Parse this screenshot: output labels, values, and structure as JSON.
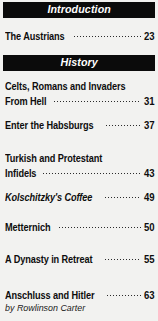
{
  "document": {
    "type": "table-of-contents",
    "background_color": "#f2f2f0",
    "bar_color": "#0b0b0b",
    "text_color": "#0d0d0d"
  },
  "sections": [
    {
      "heading": "Introduction",
      "entries": [
        {
          "title_lines": [
            "The Austrians"
          ],
          "page": "23",
          "italic": false,
          "byline": null
        }
      ]
    },
    {
      "heading": "History",
      "entries": [
        {
          "title_lines": [
            "Celts, Romans and Invaders",
            "From Hell"
          ],
          "page": "31",
          "italic": false,
          "byline": null
        },
        {
          "title_lines": [
            "Enter the Habsburgs"
          ],
          "page": "37",
          "italic": false,
          "byline": null
        },
        {
          "title_lines": [
            "Turkish and Protestant",
            "Infidels"
          ],
          "page": "43",
          "italic": false,
          "byline": null
        },
        {
          "title_lines": [
            "Kolschitzky's Coffee"
          ],
          "page": "49",
          "italic": true,
          "byline": null
        },
        {
          "title_lines": [
            "Metternich"
          ],
          "page": "50",
          "italic": false,
          "byline": null
        },
        {
          "title_lines": [
            "A Dynasty in Retreat"
          ],
          "page": "55",
          "italic": false,
          "byline": null
        },
        {
          "title_lines": [
            "Anschluss and Hitler"
          ],
          "page": "63",
          "italic": false,
          "byline": "by Rowlinson Carter"
        }
      ]
    }
  ],
  "layout": {
    "section_bars": [
      {
        "label": "Introduction",
        "top": 2
      },
      {
        "label": "History",
        "top": 55
      }
    ],
    "entry_tops": [
      28,
      80,
      117,
      152,
      189,
      219,
      251,
      287
    ]
  }
}
